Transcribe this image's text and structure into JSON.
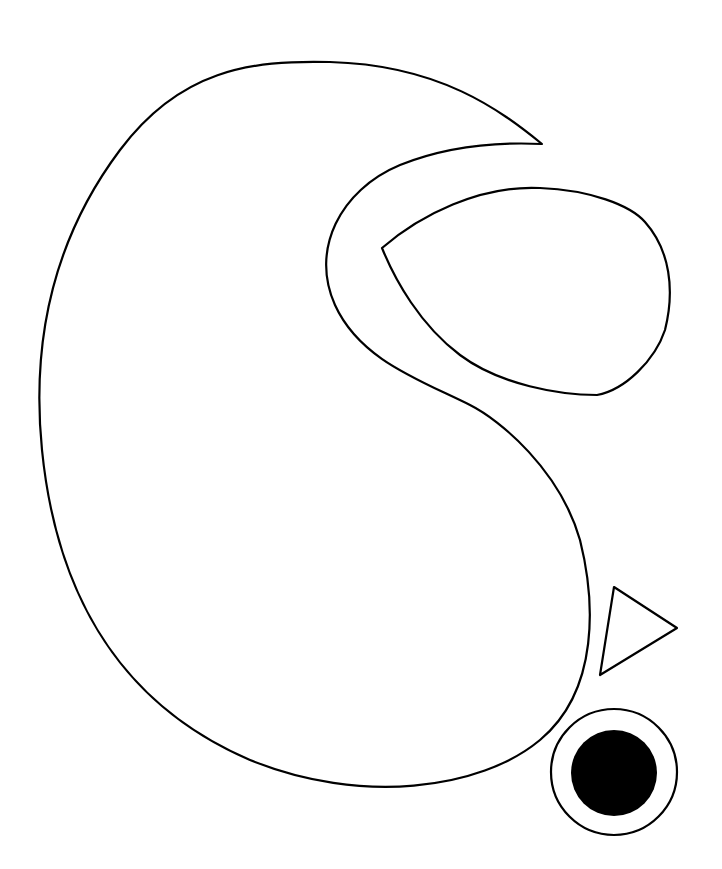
{
  "canvas": {
    "width": 722,
    "height": 869,
    "background": "#ffffff"
  },
  "colors": {
    "stroke": "#000000",
    "fill": "#ffffff",
    "dot": "#000000"
  },
  "shapes": {
    "bean": {
      "kind": "path",
      "d": "M 542 144 C 500 110 440 65 330 62 C 250 60 180 70 120 150 C 60 230 30 330 42 450 C 55 580 110 700 250 760 C 360 805 480 790 540 740 C 600 690 595 600 580 540 C 560 470 500 420 470 405 C 420 380 360 360 335 305 C 310 250 340 190 400 165 C 450 145 500 142 542 144 Z"
    },
    "teardrop": {
      "kind": "path",
      "d": "M 382 248 C 420 215 480 185 540 188 C 590 190 630 205 645 222 C 670 250 675 290 665 330 C 655 360 625 390 597 395 C 560 395 500 385 460 355 C 420 325 395 280 382 248 Z"
    },
    "triangle": {
      "kind": "polygon",
      "points": "614,587 677,628 600,675"
    },
    "ring": {
      "kind": "circle",
      "cx": 614,
      "cy": 772,
      "r": 63
    },
    "dot": {
      "kind": "circle",
      "cx": 614,
      "cy": 773,
      "r": 43
    }
  }
}
